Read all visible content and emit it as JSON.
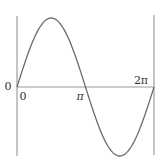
{
  "chart_data": {
    "type": "line",
    "title": "",
    "xlabel": "",
    "ylabel": "",
    "function": "sin(x)",
    "x_range": [
      0,
      6.2832
    ],
    "ylim": [
      -1,
      1
    ],
    "grid": false,
    "legend": null,
    "x_tick_labels": [
      {
        "value": 0,
        "label": "0"
      },
      {
        "value": 3.1416,
        "label": "π"
      },
      {
        "value": 6.2832,
        "label": "2π"
      }
    ],
    "left_label": "0",
    "series": [
      {
        "name": "sin x",
        "x": [
          0,
          0.7854,
          1.5708,
          2.3562,
          3.1416,
          3.927,
          4.7124,
          5.4978,
          6.2832
        ],
        "values": [
          0,
          0.707,
          1,
          0.707,
          0,
          -0.707,
          -1,
          -0.707,
          0
        ]
      }
    ],
    "colors": {
      "curve": "#6b6b6b",
      "axis": "#9a9a9a",
      "bounds": "#8a8a8a",
      "text": "#333333"
    }
  },
  "labels": {
    "y_zero": "0",
    "x_zero": "0",
    "x_pi": "π",
    "x_two_pi": "2π"
  }
}
